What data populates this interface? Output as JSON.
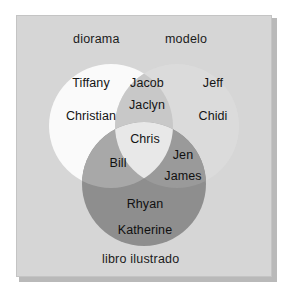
{
  "diagram": {
    "type": "venn-3-circle",
    "title": "",
    "background_color": "#d6d6d6",
    "border_color": "#c4c4c4",
    "shadow_color": "#b9b9b9",
    "text_color": "#141414",
    "sets": [
      {
        "id": "diorama",
        "label": "diorama",
        "position": "top-left",
        "fill": "#fafafa"
      },
      {
        "id": "modelo",
        "label": "modelo",
        "position": "top-right",
        "fill": "#dcdcdc"
      },
      {
        "id": "libro",
        "label": "libro ilustrado",
        "position": "bottom",
        "fill": "#8a8a8a"
      }
    ],
    "regions": [
      {
        "id": "diorama-only",
        "sets": [
          "diorama"
        ],
        "fill": "#fafafa",
        "items": [
          "Tiffany",
          "Christian"
        ]
      },
      {
        "id": "diorama-modelo",
        "sets": [
          "diorama",
          "modelo"
        ],
        "fill": "#c8c8c8",
        "items": [
          "Jacob",
          "Jaclyn"
        ]
      },
      {
        "id": "modelo-only",
        "sets": [
          "modelo"
        ],
        "fill": "#dcdcdc",
        "items": [
          "Jeff",
          "Chidi"
        ]
      },
      {
        "id": "center-all",
        "sets": [
          "diorama",
          "modelo",
          "libro"
        ],
        "fill": "#e8e8e8",
        "items": [
          "Chris"
        ]
      },
      {
        "id": "diorama-libro",
        "sets": [
          "diorama",
          "libro"
        ],
        "fill": "#a8a8a8",
        "items": [
          "Bill"
        ]
      },
      {
        "id": "modelo-libro",
        "sets": [
          "modelo",
          "libro"
        ],
        "fill": "#9a9a9a",
        "items": [
          "Jen",
          "James"
        ]
      },
      {
        "id": "libro-only",
        "sets": [
          "libro"
        ],
        "fill": "#8a8a8a",
        "items": [
          "Rhyan",
          "Katherine"
        ]
      }
    ],
    "names": {
      "tiffany": "Tiffany",
      "christian": "Christian",
      "jacob": "Jacob",
      "jaclyn": "Jaclyn",
      "jeff": "Jeff",
      "chidi": "Chidi",
      "chris": "Chris",
      "bill": "Bill",
      "jen": "Jen",
      "james": "James",
      "rhyan": "Rhyan",
      "katherine": "Katherine"
    }
  }
}
